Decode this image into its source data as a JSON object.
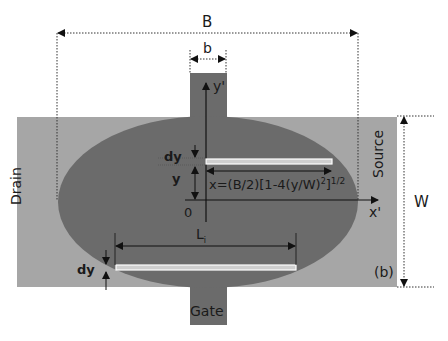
{
  "figure": {
    "panel_label": "(b)",
    "dimension_labels": {
      "overall_width": "B",
      "gate_tab_width": "b",
      "band_height": "W",
      "strip_thickness_top": "dy",
      "strip_thickness_bottom": "dy",
      "strip_offset": "y",
      "strip_length": "L",
      "strip_length_subscript": "i"
    },
    "axes": {
      "y_axis": "y'",
      "x_axis": "x'",
      "origin": "0"
    },
    "equation": {
      "main": "x=(B/2)[1-4(y/W)",
      "sq": "2",
      "close": "]",
      "power": "1/2"
    },
    "terminals": {
      "drain": "Drain",
      "source": "Source",
      "gate": "Gate"
    },
    "colors": {
      "band": "#a6a6a6",
      "ellipse": "#6b6b6b",
      "gate_tab": "#6b6b6b",
      "strip_fill": "#cfcfcf",
      "strip_border": "#ffffff",
      "line": "#1a1a1a"
    }
  }
}
